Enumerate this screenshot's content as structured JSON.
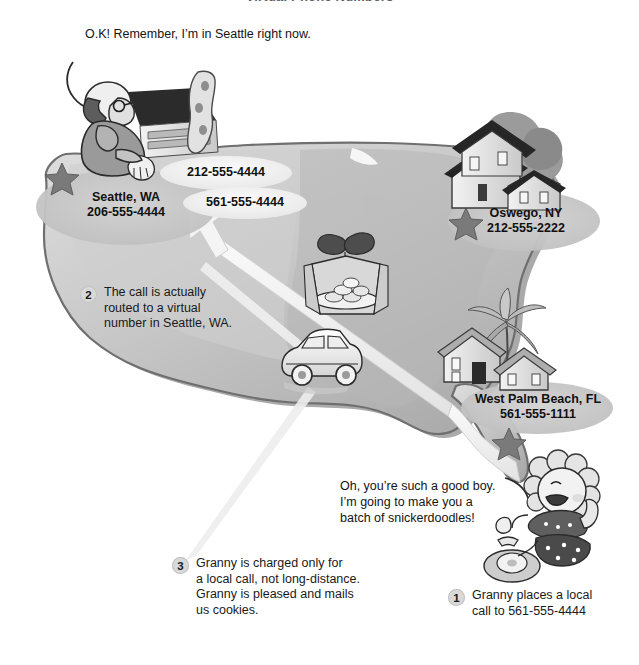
{
  "figure": {
    "title": "Virtual Phone Numbers",
    "type": "illustrated-diagram"
  },
  "palette": {
    "map_fill_light": "#d6d6d6",
    "map_fill_mid": "#bdbdbd",
    "map_fill_dark": "#9e9e9e",
    "map_outline": "#6f6f6f",
    "ellipse_shadow": "#c9c9c9",
    "badge_bg": "#d9d9d9",
    "text": "#1a1a1a",
    "title": "#5d5d66",
    "arrow_fill": "#f2f2f2",
    "arrow_stroke": "#c7c7c7"
  },
  "speech": {
    "man": "O.K! Remember, I’m in Seattle right now.",
    "granny_line1": "Oh, you’re such a good boy.",
    "granny_line2": "I’m going to make you a",
    "granny_line3": "batch of snickerdoodles!"
  },
  "pills": {
    "nyc_number": "212-555-4444",
    "fl_number": "561-555-4444"
  },
  "callouts": [
    {
      "id": "seattle",
      "city": "Seattle, WA",
      "number": "206-555-4444",
      "marker": "star-marker"
    },
    {
      "id": "oswego",
      "city": "Oswego, NY",
      "number": "212-555-2222",
      "marker": "star-marker"
    },
    {
      "id": "west-palm-beach",
      "city": "West Palm Beach, FL",
      "number": "561-555-1111",
      "marker": "star-marker"
    }
  ],
  "steps": [
    {
      "number": "1",
      "text": "Granny places a local\ncall to 561-555-4444"
    },
    {
      "number": "2",
      "text": "The call is actually\nrouted to a virtual\nnumber in Seattle, WA."
    },
    {
      "number": "3",
      "text": "Granny is charged only for\na local call, not long-distance.\nGranny is pleased and mails\nus cookies."
    }
  ],
  "icons": {
    "man_on_phone": "man-on-phone-icon",
    "granny_on_phone": "granny-on-phone-icon",
    "cabin": "cabin-house-icon",
    "two_story_house": "two-story-house-icon",
    "beach_house": "beach-house-icon",
    "palm_tree": "palm-tree-icon",
    "gift_cookies": "gift-box-cookies-icon",
    "car": "car-icon",
    "rotary_phone": "rotary-phone-icon",
    "star": "star-marker-icon",
    "route_arrow": "route-arrow-icon"
  }
}
